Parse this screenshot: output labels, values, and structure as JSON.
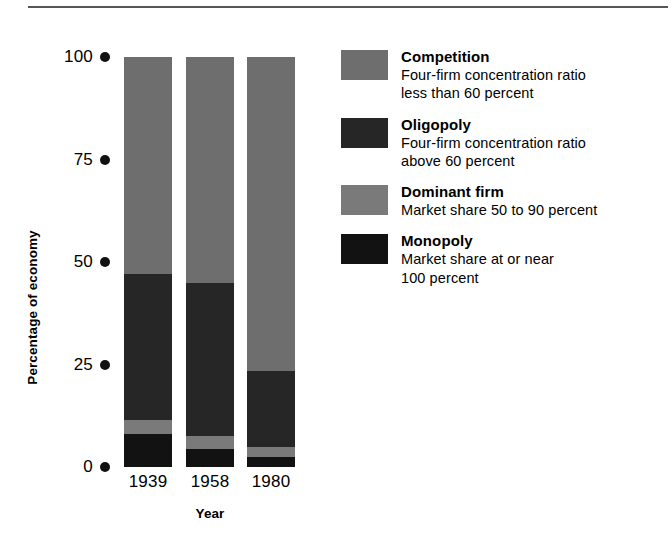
{
  "chart_data": {
    "type": "bar",
    "subtype": "stacked-bar",
    "title": "",
    "xlabel": "Year",
    "ylabel": "Percentage of economy",
    "categories": [
      "1939",
      "1958",
      "1980"
    ],
    "ylim": [
      0,
      100
    ],
    "yticks": [
      0,
      25,
      50,
      75,
      100
    ],
    "ytick_labels": [
      "0",
      "25",
      "50",
      "75",
      "100"
    ],
    "grid": false,
    "legend_position": "right",
    "stack_order_bottom_to_top": [
      "Monopoly",
      "Dominant firm",
      "Oligopoly",
      "Competition"
    ],
    "series": [
      {
        "name": "Competition",
        "color": "#6e6e6e",
        "values": [
          53.0,
          55.0,
          76.5
        ]
      },
      {
        "name": "Oligopoly",
        "color": "#262626",
        "values": [
          35.5,
          37.5,
          18.5
        ]
      },
      {
        "name": "Dominant firm",
        "color": "#7a7a7a",
        "values": [
          3.5,
          3.0,
          2.5
        ]
      },
      {
        "name": "Monopoly",
        "color": "#121212",
        "values": [
          8.0,
          4.5,
          2.5
        ]
      }
    ]
  },
  "axis": {
    "y_title": "Percentage of economy",
    "x_title": "Year",
    "y_ticks": [
      {
        "label": "100",
        "value": 100
      },
      {
        "label": "75",
        "value": 75
      },
      {
        "label": "50",
        "value": 50
      },
      {
        "label": "25",
        "value": 25
      },
      {
        "label": "0",
        "value": 0
      }
    ],
    "x_ticks": [
      "1939",
      "1958",
      "1980"
    ]
  },
  "legend": {
    "items": [
      {
        "key": "competition",
        "title": "Competition",
        "description": "Four-firm concentration ratio\nless than 60 percent",
        "color": "#6e6e6e"
      },
      {
        "key": "oligopoly",
        "title": "Oligopoly",
        "description": "Four-firm concentration ratio\nabove 60 percent",
        "color": "#262626"
      },
      {
        "key": "dominant-firm",
        "title": "Dominant firm",
        "description": "Market share 50 to 90 percent",
        "color": "#7a7a7a"
      },
      {
        "key": "monopoly",
        "title": "Monopoly",
        "description": "Market share at or near\n100 percent",
        "color": "#121212"
      }
    ]
  }
}
